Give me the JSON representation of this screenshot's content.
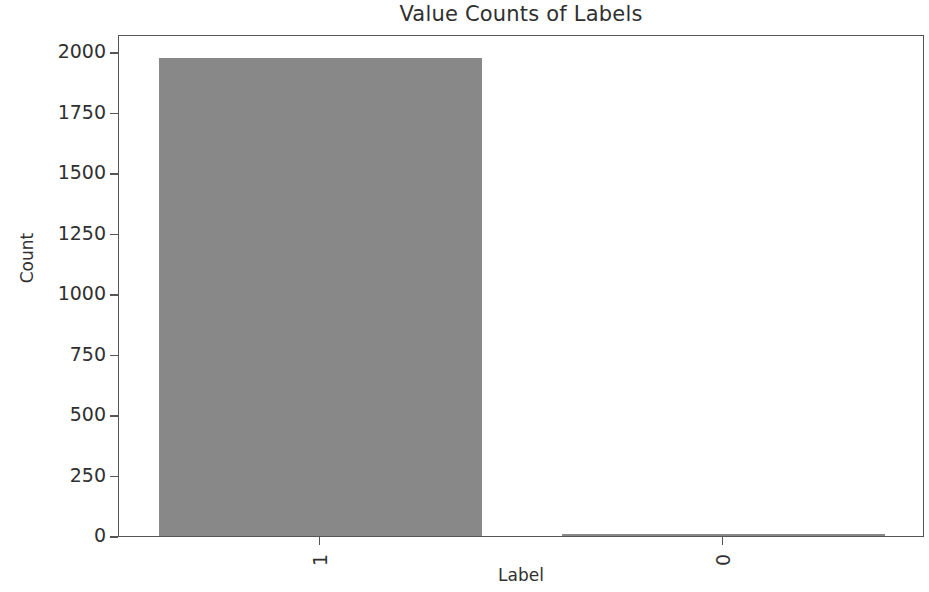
{
  "chart_data": {
    "type": "bar",
    "title": "Value Counts of Labels",
    "xlabel": "Label",
    "ylabel": "Count",
    "categories": [
      "1",
      "0"
    ],
    "values": [
      1975,
      5
    ],
    "ylim": [
      0,
      2075
    ],
    "yticks": [
      0,
      250,
      500,
      750,
      1000,
      1250,
      1500,
      1750,
      2000
    ],
    "ytick_labels": [
      "0",
      "250",
      "500",
      "750",
      "1000",
      "1250",
      "1500",
      "1750",
      "2000"
    ],
    "xtick_labels": [
      "1",
      "0"
    ],
    "xtick_rotation": 90,
    "grid": false,
    "legend": false,
    "bar_color": "#888888",
    "bar_width_ratio": 0.8,
    "axes_color": "#555555",
    "text_color": "#303030",
    "background": "#ffffff"
  }
}
